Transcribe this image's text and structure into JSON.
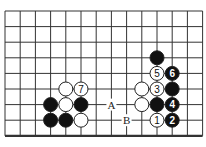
{
  "diagram": {
    "type": "go-board-fragment",
    "grid": {
      "columns": 14,
      "rows": 9,
      "origin_x": 5,
      "origin_y": 11,
      "spacing_x": 15.2,
      "spacing_y": 15.6,
      "bottom_edge_thick": true
    },
    "colors": {
      "line": "#333333",
      "black_stone": "#111111",
      "white_stone": "#ffffff",
      "stone_stroke": "#222222",
      "background": "#ffffff"
    },
    "stones": [
      {
        "col": 4,
        "row": 5,
        "color": "white",
        "label": ""
      },
      {
        "col": 5,
        "row": 5,
        "color": "white",
        "label": "7"
      },
      {
        "col": 3,
        "row": 6,
        "color": "black",
        "label": ""
      },
      {
        "col": 4,
        "row": 6,
        "color": "white",
        "label": ""
      },
      {
        "col": 5,
        "row": 6,
        "color": "black",
        "label": ""
      },
      {
        "col": 3,
        "row": 7,
        "color": "black",
        "label": ""
      },
      {
        "col": 4,
        "row": 7,
        "color": "black",
        "label": ""
      },
      {
        "col": 5,
        "row": 7,
        "color": "white",
        "label": ""
      },
      {
        "col": 10,
        "row": 3,
        "color": "black",
        "label": ""
      },
      {
        "col": 10,
        "row": 4,
        "color": "white",
        "label": "5"
      },
      {
        "col": 11,
        "row": 4,
        "color": "black",
        "label": "6"
      },
      {
        "col": 9,
        "row": 5,
        "color": "white",
        "label": ""
      },
      {
        "col": 10,
        "row": 5,
        "color": "white",
        "label": "3"
      },
      {
        "col": 11,
        "row": 5,
        "color": "black",
        "label": ""
      },
      {
        "col": 9,
        "row": 6,
        "color": "white",
        "label": ""
      },
      {
        "col": 10,
        "row": 6,
        "color": "black",
        "label": ""
      },
      {
        "col": 11,
        "row": 6,
        "color": "black",
        "label": "4"
      },
      {
        "col": 10,
        "row": 7,
        "color": "white",
        "label": "1"
      },
      {
        "col": 11,
        "row": 7,
        "color": "black",
        "label": "2"
      }
    ],
    "markers": [
      {
        "col": 7,
        "row": 6,
        "label": "A"
      },
      {
        "col": 8,
        "row": 7,
        "label": "B"
      }
    ]
  }
}
